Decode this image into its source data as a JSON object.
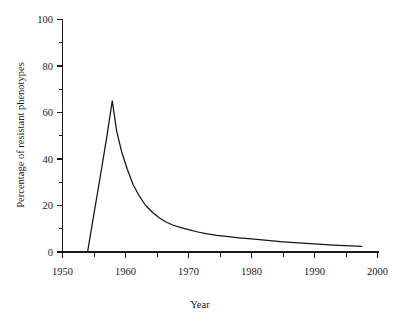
{
  "chart_data": {
    "type": "line",
    "title": "",
    "xlabel": "Year",
    "ylabel": "Percentage of resistant phenotypes",
    "xlim": [
      1950,
      2002
    ],
    "ylim": [
      0,
      100
    ],
    "grid": false,
    "legend": "none",
    "x_ticks_major": [
      1950,
      1960,
      1970,
      1980,
      1990,
      2000
    ],
    "x_tick_labels": [
      "1950",
      "1960",
      "1970",
      "1980",
      "1990",
      "2000"
    ],
    "x_ticks_minor": [
      1955,
      1965,
      1975,
      1985,
      1995
    ],
    "y_ticks_major": [
      0,
      20,
      40,
      60,
      80,
      100
    ],
    "y_tick_labels": [
      "0",
      "20",
      "40",
      "60",
      "80",
      "100"
    ],
    "y_ticks_minor": [
      10,
      30,
      50,
      70,
      90
    ],
    "series": [
      {
        "name": "Resistant phenotypes",
        "color": "#141414",
        "x": [
          1954.0,
          1955.0,
          1956.0,
          1957.0,
          1957.9,
          1958.6,
          1959.4,
          1960.3,
          1961.2,
          1962.2,
          1963.2,
          1964.3,
          1965.4,
          1966.5,
          1967.6,
          1968.8,
          1970.0,
          1971.5,
          1973.0,
          1974.5,
          1976.0,
          1978.0,
          1980.0,
          1982.5,
          1985.0,
          1987.5,
          1990.0,
          1993.0,
          1997.5
        ],
        "y": [
          0.4,
          16.5,
          32.5,
          49.0,
          65.0,
          52.0,
          43.0,
          35.5,
          29.0,
          24.0,
          20.0,
          17.0,
          14.6,
          12.8,
          11.5,
          10.5,
          9.6,
          8.6,
          7.8,
          7.2,
          6.7,
          6.1,
          5.6,
          5.0,
          4.4,
          3.9,
          3.5,
          3.0,
          2.4
        ]
      }
    ],
    "annotations": {
      "peak_year": "1958",
      "peak_value": "65"
    }
  },
  "figure": {
    "background_color": "#ffffff",
    "line_color": "#141414",
    "axis_color": "#1a1a1a"
  }
}
